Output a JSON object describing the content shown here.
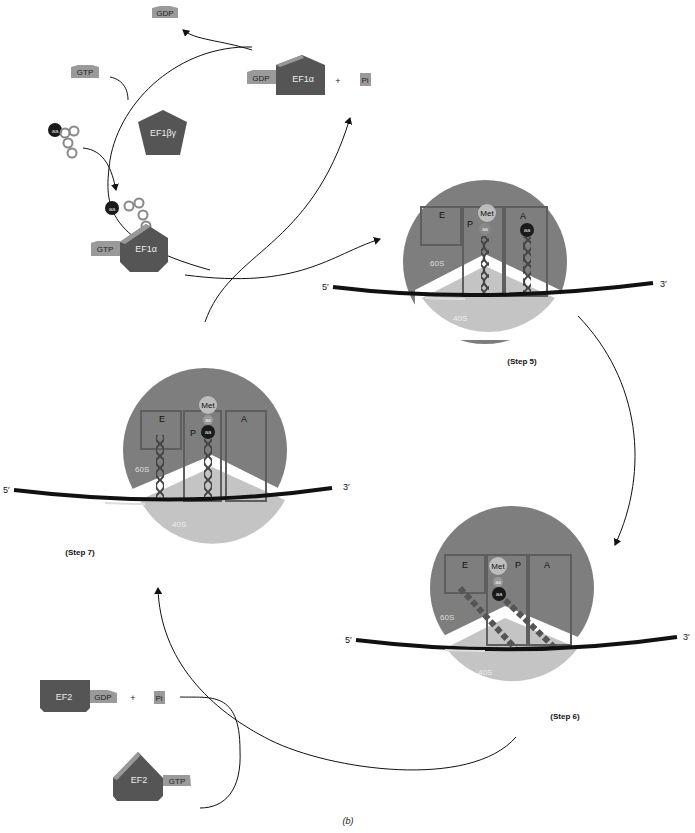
{
  "figure_label": "(b)",
  "colors": {
    "subunit_60S": "#7e7e7e",
    "subunit_40S": "#c4c4c4",
    "site_box": "#5e5e5e",
    "factor_dark": "#555555",
    "nucleotide_tag": "#9a9a9a",
    "mrna": "#111111",
    "met": "#bdbdbd",
    "aa_dark": "#1a1a1a"
  },
  "elongation_factor_1": {
    "released_gdp": "GDP",
    "incoming_gtp": "GTP",
    "exchange_factor": "EF1βγ",
    "charged_trna_aa": "aa",
    "ternary_complex": {
      "nucleotide": "GTP",
      "factor": "EF1α",
      "aa": "aa"
    },
    "released_complex": {
      "nucleotide": "GDP",
      "factor": "EF1α"
    },
    "plus": "+",
    "phosphate": "Pi"
  },
  "elongation_factor_2": {
    "spent": {
      "factor": "EF2",
      "nucleotide": "GDP"
    },
    "plus": "+",
    "phosphate": "Pi",
    "active": {
      "factor": "EF2",
      "nucleotide": "GTP"
    }
  },
  "steps": [
    {
      "label": "(Step 5)",
      "large_subunit": "60S",
      "small_subunit": "40S",
      "sites": [
        "E",
        "P",
        "A"
      ],
      "met": "Met",
      "p_aa": "aa",
      "a_aa": "aa",
      "five_prime": "5′",
      "three_prime": "3′"
    },
    {
      "label": "(Step 6)",
      "large_subunit": "60S",
      "small_subunit": "40S",
      "sites": [
        "E",
        "P",
        "A"
      ],
      "met": "Met",
      "aa1": "aa",
      "aa2": "aa",
      "five_prime": "5′",
      "three_prime": "3′"
    },
    {
      "label": "(Step 7)",
      "large_subunit": "60S",
      "small_subunit": "40S",
      "sites": [
        "E",
        "P",
        "A"
      ],
      "met": "Met",
      "aa1": "aa",
      "aa2": "aa",
      "five_prime": "5′",
      "three_prime": "3′"
    }
  ]
}
